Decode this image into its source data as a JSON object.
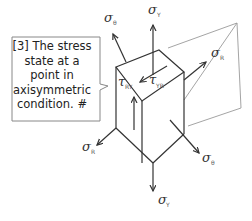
{
  "callout": {
    "text": "[3] The stress state at a point in axisymmetric condition. #"
  },
  "labels": {
    "sigma_theta_top": {
      "symbol": "σ",
      "sub": "θ"
    },
    "sigma_y_top": {
      "symbol": "σ",
      "sub": "Y"
    },
    "sigma_r_right": {
      "symbol": "σ",
      "sub": "R"
    },
    "tau_ry": {
      "symbol": "τ",
      "sub": "RY"
    },
    "tau_yr": {
      "symbol": "τ",
      "sub": "YR"
    },
    "sigma_r_left": {
      "symbol": "σ",
      "sub": "R"
    },
    "sigma_theta_bottom": {
      "symbol": "σ",
      "sub": "θ"
    },
    "sigma_y_bottom": {
      "symbol": "σ",
      "sub": "Y"
    }
  },
  "colors": {
    "line": "#333333",
    "plane": "#9a9a9a",
    "callout_border": "#888888"
  }
}
